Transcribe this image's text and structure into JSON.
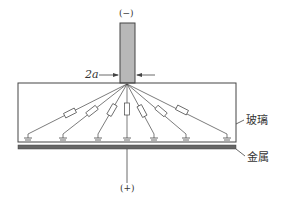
{
  "labels": {
    "negative": "(−)",
    "positive": "(+)",
    "width": "2a",
    "glass": "玻璃",
    "metal": "金属"
  },
  "colors": {
    "line": "#444444",
    "electrode_fill": "#b8b8b8",
    "metal_fill": "#666666"
  }
}
